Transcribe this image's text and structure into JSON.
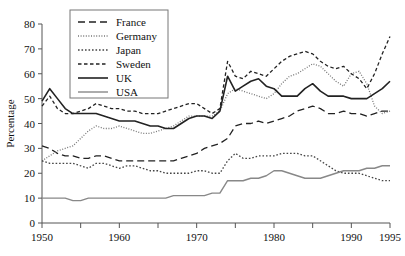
{
  "chart_data": {
    "type": "line",
    "title": "",
    "xlabel": "",
    "ylabel": "Percentage",
    "xlim": [
      1950,
      1995
    ],
    "ylim": [
      0,
      80
    ],
    "ytick_step": 10,
    "yticks": [
      0,
      10,
      20,
      30,
      40,
      50,
      60,
      70,
      80
    ],
    "xticks_major": [
      1950,
      1960,
      1970,
      1980,
      1990,
      1995
    ],
    "xticks_minor": [
      1955,
      1965,
      1975,
      1985
    ],
    "grid": false,
    "legend_position": "top-left",
    "x": [
      1950,
      1951,
      1952,
      1953,
      1954,
      1955,
      1956,
      1957,
      1958,
      1959,
      1960,
      1961,
      1962,
      1963,
      1964,
      1965,
      1966,
      1967,
      1968,
      1969,
      1970,
      1971,
      1972,
      1973,
      1974,
      1975,
      1976,
      1977,
      1978,
      1979,
      1980,
      1981,
      1982,
      1983,
      1984,
      1985,
      1986,
      1987,
      1988,
      1989,
      1990,
      1991,
      1992,
      1993,
      1994,
      1995
    ],
    "series": [
      {
        "name": "France",
        "style": "dashed",
        "color": "#222222",
        "width": 1.3,
        "dash": "7,4",
        "values": [
          31,
          30,
          28,
          27,
          27,
          26,
          26,
          27,
          27,
          26,
          25,
          25,
          25,
          25,
          25,
          25,
          25,
          25,
          26,
          27,
          28,
          30,
          31,
          32,
          34,
          39,
          40,
          40,
          41,
          40,
          41,
          42,
          43,
          45,
          46,
          47,
          46,
          44,
          44,
          45,
          44,
          44,
          43,
          44,
          45,
          45
        ]
      },
      {
        "name": "Germany",
        "style": "dotted-fine",
        "color": "#777777",
        "width": 1.3,
        "dash": "1,1.6",
        "values": [
          25,
          27,
          29,
          30,
          31,
          34,
          37,
          39,
          38,
          38,
          39,
          38,
          37,
          36,
          36,
          37,
          38,
          39,
          41,
          43,
          43,
          43,
          43,
          45,
          52,
          54,
          53,
          52,
          51,
          50,
          52,
          56,
          59,
          60,
          62,
          64,
          63,
          60,
          57,
          55,
          60,
          61,
          56,
          47,
          44,
          45
        ]
      },
      {
        "name": "Japan",
        "style": "dotted",
        "color": "#444444",
        "width": 1.3,
        "dash": "1.6,1.9",
        "values": [
          25,
          24,
          24,
          24,
          24,
          23,
          22,
          24,
          24,
          23,
          22,
          23,
          23,
          22,
          21,
          21,
          20,
          20,
          20,
          20,
          21,
          21,
          20,
          20,
          25,
          28,
          26,
          26,
          27,
          27,
          27,
          28,
          28,
          28,
          27,
          27,
          25,
          23,
          21,
          20,
          20,
          20,
          19,
          18,
          17,
          17
        ]
      },
      {
        "name": "Sweden",
        "style": "dashed-short",
        "color": "#222222",
        "width": 1.3,
        "dash": "3.5,2.5",
        "values": [
          47,
          51,
          46,
          44,
          44,
          45,
          46,
          48,
          47,
          46,
          46,
          45,
          45,
          44,
          44,
          44,
          45,
          46,
          47,
          48,
          48,
          46,
          44,
          46,
          65,
          59,
          58,
          61,
          60,
          59,
          62,
          65,
          67,
          68,
          69,
          68,
          65,
          63,
          62,
          63,
          60,
          58,
          54,
          60,
          68,
          75
        ]
      },
      {
        "name": "UK",
        "style": "solid",
        "color": "#222222",
        "width": 1.6,
        "dash": "",
        "values": [
          49,
          54,
          50,
          46,
          44,
          44,
          44,
          44,
          43,
          42,
          41,
          41,
          41,
          40,
          39,
          39,
          38,
          38,
          40,
          42,
          43,
          43,
          42,
          45,
          59,
          53,
          55,
          57,
          58,
          55,
          54,
          51,
          51,
          51,
          54,
          56,
          53,
          51,
          51,
          51,
          50,
          50,
          50,
          52,
          54,
          57
        ]
      },
      {
        "name": "USA",
        "style": "solid-light",
        "color": "#888888",
        "width": 1.4,
        "dash": "",
        "values": [
          10,
          10,
          10,
          10,
          9,
          9,
          10,
          10,
          10,
          10,
          10,
          10,
          10,
          10,
          10,
          10,
          10,
          11,
          11,
          11,
          11,
          11,
          12,
          12,
          17,
          17,
          17,
          18,
          18,
          19,
          21,
          21,
          20,
          19,
          18,
          18,
          18,
          19,
          20,
          21,
          21,
          21,
          22,
          22,
          23,
          23
        ]
      }
    ]
  }
}
